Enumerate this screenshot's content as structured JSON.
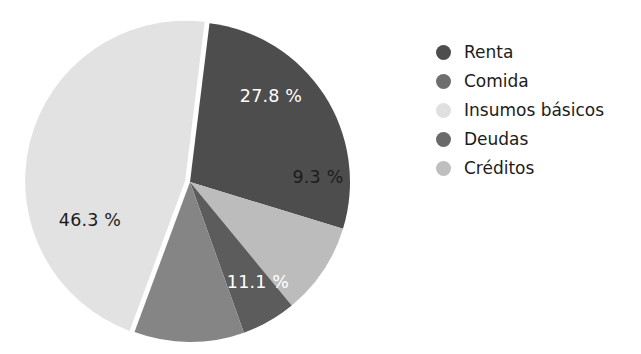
{
  "chart_data": {
    "type": "pie",
    "title": "",
    "subtitle": "",
    "xlabel": "",
    "ylabel": "",
    "grid": false,
    "legend_position": "right",
    "center": {
      "x": 190,
      "y": 182
    },
    "radius": 160,
    "start_angle_deg": -83,
    "direction": "clockwise",
    "categories": [
      "Renta",
      "Comida",
      "Insumos básicos",
      "Deudas",
      "Créditos"
    ],
    "values": [
      27.8,
      11.1,
      46.3,
      5.5,
      9.3
    ],
    "colors": [
      "#4d4d4d",
      "#858585",
      "#e2e2e2",
      "#5c5c5c",
      "#bcbcbc"
    ],
    "slices": [
      {
        "name": "Renta",
        "value": 27.8,
        "label": "27.8 %",
        "color": "#4d4d4d",
        "label_color": "#ffffff",
        "label_x": 271,
        "label_y": 97,
        "start_deg": -83,
        "end_deg": 17,
        "exploded": false
      },
      {
        "name": "Créditos",
        "value": 9.3,
        "label": "9.3 %",
        "color": "#bcbcbc",
        "label_color": "#1c1c1c",
        "label_x": 318,
        "label_y": 178,
        "start_deg": 17,
        "end_deg": 50.5,
        "exploded": false
      },
      {
        "name": "Deudas",
        "value": 5.5,
        "label": "",
        "color": "#5c5c5c",
        "label_color": "#ffffff",
        "label_x": 286,
        "label_y": 226,
        "start_deg": 50.5,
        "end_deg": 70.3,
        "exploded": false
      },
      {
        "name": "Comida",
        "value": 11.1,
        "label": "11.1 %",
        "color": "#858585",
        "label_color": "#ffffff",
        "label_x": 258,
        "label_y": 283,
        "start_deg": 70.3,
        "end_deg": 110.3,
        "exploded": false
      },
      {
        "name": "Insumos básicos",
        "value": 46.3,
        "label": "46.3 %",
        "color": "#e2e2e2",
        "label_color": "#1c1c1c",
        "label_x": 90,
        "label_y": 221,
        "start_deg": 110.3,
        "end_deg": 277,
        "exploded": true
      }
    ]
  },
  "legend": {
    "items": [
      {
        "label": "Renta",
        "color": "#4d4d4d",
        "icon": "legend-dot-icon"
      },
      {
        "label": "Comida",
        "color": "#6e6e6e",
        "icon": "legend-dot-icon"
      },
      {
        "label": "Insumos básicos",
        "color": "#e0e0e0",
        "icon": "legend-dot-icon"
      },
      {
        "label": "Deudas",
        "color": "#6a6a6a",
        "icon": "legend-dot-icon"
      },
      {
        "label": "Créditos",
        "color": "#bfbfbf",
        "icon": "legend-dot-icon"
      }
    ]
  },
  "background_color": "#ffffff"
}
